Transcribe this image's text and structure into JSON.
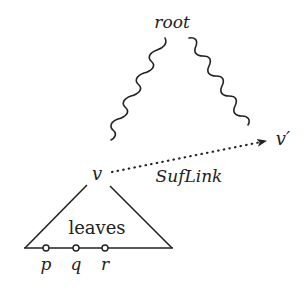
{
  "diagram": {
    "type": "suffix-tree-illustration",
    "colors": {
      "ink": "#222222",
      "background": "#ffffff"
    },
    "nodes": {
      "root": {
        "label": "root"
      },
      "v": {
        "label": "v"
      },
      "v_prime": {
        "label": "v′"
      }
    },
    "edges": [
      {
        "from": "root",
        "to": "v",
        "style": "wavy"
      },
      {
        "from": "root",
        "to": "v_prime",
        "style": "wavy"
      },
      {
        "from": "v",
        "to": "v_prime",
        "style": "dotted-arrow",
        "label": "SufLink"
      }
    ],
    "subtree": {
      "label": "leaves",
      "leaves": [
        {
          "label": "p"
        },
        {
          "label": "q"
        },
        {
          "label": "r"
        }
      ]
    }
  }
}
